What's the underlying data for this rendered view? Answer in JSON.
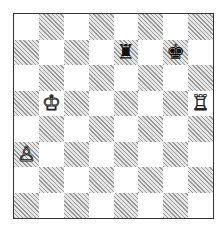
{
  "diagram": {
    "type": "chess-position",
    "files": [
      "a",
      "b",
      "c",
      "d",
      "e",
      "f",
      "g",
      "h"
    ],
    "ranks": [
      8,
      7,
      6,
      5,
      4,
      3,
      2,
      1
    ],
    "pieces": [
      {
        "square": "e7",
        "color": "black",
        "piece": "rook",
        "glyph": "♜"
      },
      {
        "square": "g7",
        "color": "black",
        "piece": "king",
        "glyph": "♚"
      },
      {
        "square": "b5",
        "color": "white",
        "piece": "king",
        "glyph": "♔"
      },
      {
        "square": "h5",
        "color": "white",
        "piece": "rook",
        "glyph": "♖"
      },
      {
        "square": "a3",
        "color": "white",
        "piece": "pawn",
        "glyph": "♙"
      }
    ],
    "colors": {
      "light": "#ffffff",
      "dark_hatch": "#9a9a9a",
      "border": "#333333"
    }
  }
}
